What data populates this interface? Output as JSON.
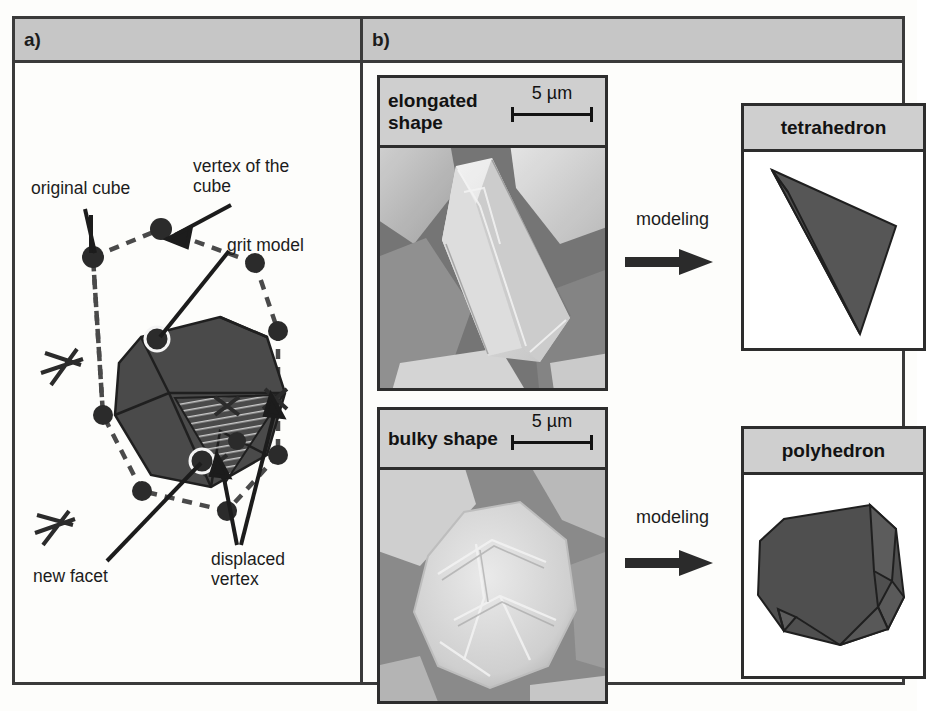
{
  "figure": {
    "panels": [
      {
        "id": "a",
        "label": "a)"
      },
      {
        "id": "b",
        "label": "b)"
      }
    ]
  },
  "panel_a": {
    "title": "a)",
    "annotations": [
      {
        "name": "original-cube",
        "text": "original cube"
      },
      {
        "name": "vertex-of-cube",
        "text": "vertex of the\ncube"
      },
      {
        "name": "grit-model",
        "text": "grit model"
      },
      {
        "name": "new-facet",
        "text": "new facet"
      },
      {
        "name": "displaced-vertex",
        "text": "displaced\nvertex"
      }
    ],
    "colors": {
      "grit_fill": "#4a4a4a",
      "grit_stroke": "#1f1f1f",
      "dashed_cube": "#4a4a4a",
      "vertex_marker": "#2b2b2b"
    }
  },
  "panel_b": {
    "title": "b)",
    "rows": [
      {
        "name": "elongated",
        "sem_caption": "elongated\nshape",
        "scalebar": "5 µm",
        "sem_alt": "SEM micrograph of elongated abrasive grit",
        "process_label": "modeling",
        "model_caption": "tetrahedron"
      },
      {
        "name": "bulky",
        "sem_caption": "bulky shape",
        "scalebar": "5 µm",
        "sem_alt": "SEM micrograph of bulky abrasive grit",
        "process_label": "modeling",
        "model_caption": "polyhedron"
      }
    ],
    "colors": {
      "caption_band": "#cfcfcf",
      "border": "#2d2d2d",
      "model_fill": "#4f4f4f",
      "arrow": "#2b2b2b"
    }
  }
}
